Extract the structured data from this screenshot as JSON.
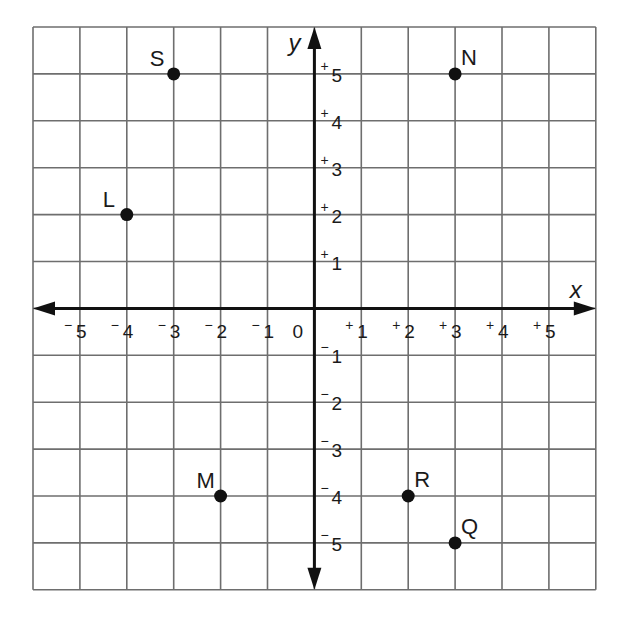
{
  "chart_data": {
    "type": "scatter",
    "title": "",
    "xlabel": "x",
    "ylabel": "y",
    "xlim": [
      -6,
      6
    ],
    "ylim": [
      -6,
      6
    ],
    "grid": true,
    "origin_label": "0",
    "x_ticks": [
      {
        "value": -5,
        "sign": "−",
        "num": "5"
      },
      {
        "value": -4,
        "sign": "−",
        "num": "4"
      },
      {
        "value": -3,
        "sign": "−",
        "num": "3"
      },
      {
        "value": -2,
        "sign": "−",
        "num": "2"
      },
      {
        "value": -1,
        "sign": "−",
        "num": "1"
      },
      {
        "value": 1,
        "sign": "+",
        "num": "1"
      },
      {
        "value": 2,
        "sign": "+",
        "num": "2"
      },
      {
        "value": 3,
        "sign": "+",
        "num": "3"
      },
      {
        "value": 4,
        "sign": "+",
        "num": "4"
      },
      {
        "value": 5,
        "sign": "+",
        "num": "5"
      }
    ],
    "y_ticks": [
      {
        "value": 5,
        "sign": "+",
        "num": "5"
      },
      {
        "value": 4,
        "sign": "+",
        "num": "4"
      },
      {
        "value": 3,
        "sign": "+",
        "num": "3"
      },
      {
        "value": 2,
        "sign": "+",
        "num": "2"
      },
      {
        "value": 1,
        "sign": "+",
        "num": "1"
      },
      {
        "value": -1,
        "sign": "−",
        "num": "1"
      },
      {
        "value": -2,
        "sign": "−",
        "num": "2"
      },
      {
        "value": -3,
        "sign": "−",
        "num": "3"
      },
      {
        "value": -4,
        "sign": "−",
        "num": "4"
      },
      {
        "value": -5,
        "sign": "−",
        "num": "5"
      }
    ],
    "points": [
      {
        "label": "S",
        "x": -3,
        "y": 5,
        "label_pos": "upper-left"
      },
      {
        "label": "N",
        "x": 3,
        "y": 5,
        "label_pos": "upper-right"
      },
      {
        "label": "L",
        "x": -4,
        "y": 2,
        "label_pos": "upper-left"
      },
      {
        "label": "M",
        "x": -2,
        "y": -4,
        "label_pos": "upper-left"
      },
      {
        "label": "R",
        "x": 2,
        "y": -4,
        "label_pos": "upper-right"
      },
      {
        "label": "Q",
        "x": 3,
        "y": -5,
        "label_pos": "upper-right"
      }
    ],
    "colors": {
      "grid": "#6e6e6e",
      "axis": "#111111",
      "point": "#111111",
      "background": "#ffffff"
    }
  }
}
